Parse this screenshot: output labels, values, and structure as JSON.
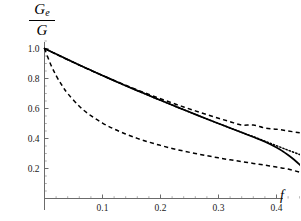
{
  "chart_data": {
    "type": "line",
    "title": "",
    "subtitle": "",
    "ylabel": "Ge/G",
    "ylabel_numerator": "Ge",
    "ylabel_numerator_base": "G",
    "ylabel_numerator_sub": "e",
    "ylabel_denominator": "G",
    "xlabel": "f",
    "xlim": [
      0,
      0.47
    ],
    "ylim": [
      0,
      1.06
    ],
    "xticks": [
      0.1,
      0.2,
      0.3,
      0.4
    ],
    "xtick_labels": [
      "0.1",
      "0.2",
      "0.3",
      "0.4"
    ],
    "yticks": [
      0.2,
      0.4,
      0.6,
      0.8,
      1.0
    ],
    "ytick_labels": [
      "0.2",
      "0.4",
      "0.6",
      "0.8",
      "1.0"
    ],
    "x_minor_ticks": [
      0.02,
      0.04,
      0.06,
      0.08,
      0.12,
      0.14,
      0.16,
      0.18,
      0.22,
      0.24,
      0.26,
      0.28,
      0.32,
      0.34,
      0.36,
      0.38,
      0.42,
      0.44,
      0.46
    ],
    "y_minor_ticks": [
      0.05,
      0.1,
      0.15,
      0.25,
      0.3,
      0.35,
      0.45,
      0.5,
      0.55,
      0.65,
      0.7,
      0.75,
      0.85,
      0.9,
      0.95,
      1.05
    ],
    "grid": false,
    "legend": "none",
    "legend_position": "none",
    "axis_color": "#6b6b6b",
    "curve_color": "#000000",
    "series": [
      {
        "name": "solid-curve",
        "style": "solid",
        "x": [
          0.0,
          0.02,
          0.04,
          0.06,
          0.08,
          0.1,
          0.12,
          0.14,
          0.16,
          0.18,
          0.2,
          0.22,
          0.24,
          0.26,
          0.28,
          0.3,
          0.32,
          0.34,
          0.36,
          0.38,
          0.4,
          0.41,
          0.42,
          0.43,
          0.44,
          0.445,
          0.45
        ],
        "y": [
          1.0,
          0.963,
          0.926,
          0.89,
          0.855,
          0.82,
          0.786,
          0.752,
          0.719,
          0.687,
          0.655,
          0.623,
          0.592,
          0.561,
          0.53,
          0.5,
          0.47,
          0.44,
          0.41,
          0.378,
          0.34,
          0.317,
          0.29,
          0.26,
          0.225,
          0.205,
          0.188
        ]
      },
      {
        "name": "upper-dashed-curve",
        "style": "dashed",
        "x": [
          0.0,
          0.02,
          0.04,
          0.06,
          0.08,
          0.1,
          0.12,
          0.14,
          0.16,
          0.18,
          0.2,
          0.22,
          0.24,
          0.26,
          0.28,
          0.3,
          0.32,
          0.34,
          0.36,
          0.38,
          0.4,
          0.42,
          0.44,
          0.45
        ],
        "y": [
          1.0,
          0.962,
          0.925,
          0.889,
          0.854,
          0.82,
          0.787,
          0.755,
          0.724,
          0.694,
          0.665,
          0.637,
          0.61,
          0.584,
          0.559,
          0.535,
          0.512,
          0.49,
          0.49,
          0.47,
          0.462,
          0.45,
          0.438,
          0.432
        ]
      },
      {
        "name": "lower-dashed-curve",
        "style": "dashed",
        "x": [
          0.0,
          0.01,
          0.02,
          0.03,
          0.04,
          0.06,
          0.08,
          0.1,
          0.12,
          0.14,
          0.16,
          0.18,
          0.2,
          0.22,
          0.24,
          0.26,
          0.28,
          0.3,
          0.32,
          0.34,
          0.36,
          0.38,
          0.4,
          0.42,
          0.44,
          0.45
        ],
        "y": [
          1.0,
          0.9,
          0.82,
          0.755,
          0.7,
          0.615,
          0.552,
          0.503,
          0.463,
          0.43,
          0.401,
          0.376,
          0.354,
          0.334,
          0.316,
          0.3,
          0.285,
          0.271,
          0.258,
          0.246,
          0.234,
          0.222,
          0.21,
          0.196,
          0.175,
          0.162
        ]
      },
      {
        "name": "dotted-curve",
        "style": "dotted",
        "x": [
          0.0,
          0.04,
          0.08,
          0.12,
          0.16,
          0.2,
          0.24,
          0.28,
          0.32,
          0.34,
          0.36,
          0.38,
          0.4,
          0.42,
          0.44,
          0.45
        ],
        "y": [
          1.0,
          0.926,
          0.855,
          0.786,
          0.719,
          0.655,
          0.592,
          0.53,
          0.47,
          0.441,
          0.412,
          0.382,
          0.352,
          0.322,
          0.293,
          0.278
        ]
      }
    ],
    "annotations": []
  }
}
